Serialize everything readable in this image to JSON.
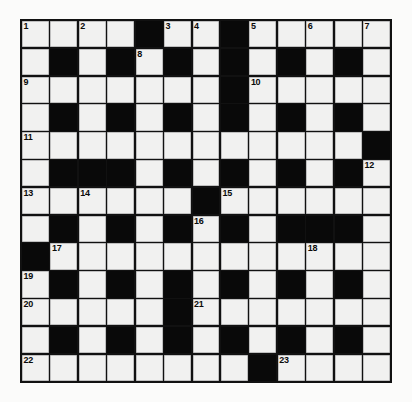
{
  "puzzle": {
    "type": "crossword-grid",
    "columns": 13,
    "rows": 13,
    "colors": {
      "white_cell": "#f1f1f0",
      "black_cell": "#090909",
      "grid_line": "#111111",
      "number_text": "#0a0a0a",
      "page_background": "#fbfbfa"
    },
    "legend": {
      "0": "white (fillable) cell",
      "1": "black (blocked) cell"
    },
    "grid": [
      [
        0,
        0,
        0,
        0,
        1,
        0,
        0,
        1,
        0,
        0,
        0,
        0,
        0
      ],
      [
        0,
        1,
        0,
        1,
        0,
        1,
        0,
        1,
        0,
        1,
        0,
        1,
        0
      ],
      [
        0,
        0,
        0,
        0,
        0,
        0,
        0,
        1,
        0,
        0,
        0,
        0,
        0
      ],
      [
        0,
        1,
        0,
        1,
        0,
        1,
        0,
        1,
        0,
        1,
        0,
        1,
        0
      ],
      [
        0,
        0,
        0,
        0,
        0,
        0,
        0,
        0,
        0,
        0,
        0,
        0,
        1
      ],
      [
        0,
        1,
        1,
        1,
        0,
        1,
        0,
        1,
        0,
        1,
        0,
        1,
        0
      ],
      [
        0,
        0,
        0,
        0,
        0,
        0,
        1,
        0,
        0,
        0,
        0,
        0,
        0
      ],
      [
        0,
        1,
        0,
        1,
        0,
        1,
        0,
        1,
        0,
        1,
        1,
        1,
        0
      ],
      [
        1,
        0,
        0,
        0,
        0,
        0,
        0,
        0,
        0,
        0,
        0,
        0,
        0
      ],
      [
        0,
        1,
        0,
        1,
        0,
        1,
        0,
        1,
        0,
        1,
        0,
        1,
        0
      ],
      [
        0,
        0,
        0,
        0,
        0,
        1,
        0,
        0,
        0,
        0,
        0,
        0,
        0
      ],
      [
        0,
        1,
        0,
        1,
        0,
        1,
        0,
        1,
        0,
        1,
        0,
        1,
        0
      ],
      [
        0,
        0,
        0,
        0,
        0,
        0,
        0,
        0,
        1,
        0,
        0,
        0,
        0
      ]
    ],
    "numbers": [
      {
        "label": "1",
        "row": 1,
        "col": 1
      },
      {
        "label": "2",
        "row": 1,
        "col": 3
      },
      {
        "label": "3",
        "row": 1,
        "col": 6
      },
      {
        "label": "4",
        "row": 1,
        "col": 7
      },
      {
        "label": "5",
        "row": 1,
        "col": 9
      },
      {
        "label": "6",
        "row": 1,
        "col": 11
      },
      {
        "label": "7",
        "row": 1,
        "col": 13
      },
      {
        "label": "8",
        "row": 2,
        "col": 5
      },
      {
        "label": "9",
        "row": 3,
        "col": 1
      },
      {
        "label": "10",
        "row": 3,
        "col": 9
      },
      {
        "label": "11",
        "row": 5,
        "col": 1
      },
      {
        "label": "12",
        "row": 6,
        "col": 13
      },
      {
        "label": "13",
        "row": 7,
        "col": 1
      },
      {
        "label": "14",
        "row": 7,
        "col": 3
      },
      {
        "label": "15",
        "row": 7,
        "col": 8
      },
      {
        "label": "16",
        "row": 8,
        "col": 7
      },
      {
        "label": "17",
        "row": 9,
        "col": 2
      },
      {
        "label": "18",
        "row": 9,
        "col": 11
      },
      {
        "label": "19",
        "row": 10,
        "col": 1
      },
      {
        "label": "20",
        "row": 11,
        "col": 1
      },
      {
        "label": "21",
        "row": 11,
        "col": 7
      },
      {
        "label": "22",
        "row": 13,
        "col": 1
      },
      {
        "label": "23",
        "row": 13,
        "col": 10
      }
    ]
  }
}
